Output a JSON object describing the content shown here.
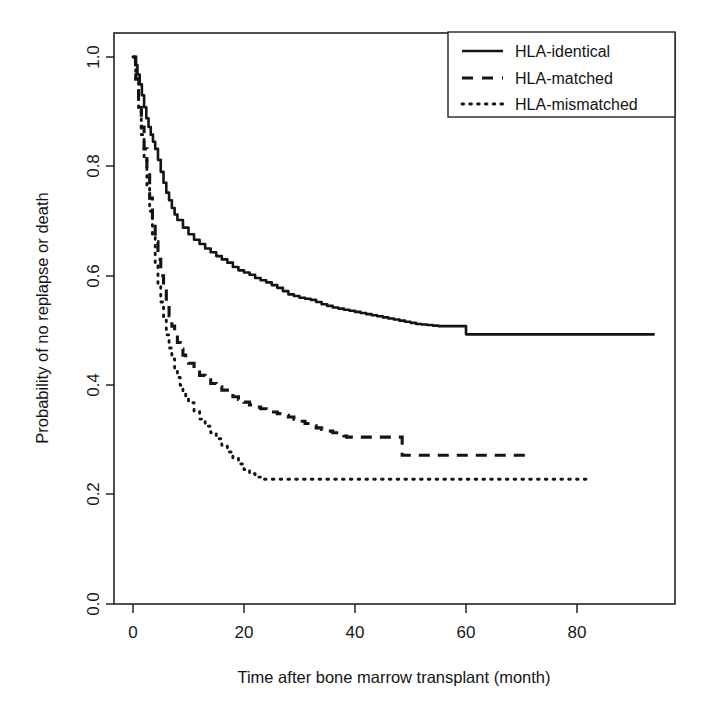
{
  "chart_data": {
    "type": "line",
    "title": "",
    "xlabel": "Time after bone marrow transplant (month)",
    "ylabel": "Probability of no replapse or death",
    "xlim": [
      -4,
      101
    ],
    "ylim": [
      0.0,
      1.04
    ],
    "xticks": [
      0,
      20,
      40,
      60,
      80
    ],
    "xtick_labels": [
      "0",
      "20",
      "40",
      "60",
      "80"
    ],
    "yticks": [
      0.0,
      0.2,
      0.4,
      0.6,
      0.8,
      1.0
    ],
    "ytick_labels": [
      "0.0",
      "0.2",
      "0.4",
      "0.6",
      "0.8",
      "1.0"
    ],
    "grid": false,
    "legend_position": "top-right",
    "series": [
      {
        "name": "HLA-identical",
        "style": "solid",
        "points": [
          [
            0.0,
            1.0
          ],
          [
            0.4,
            0.985
          ],
          [
            0.8,
            0.968
          ],
          [
            1.2,
            0.95
          ],
          [
            1.6,
            0.93
          ],
          [
            2.0,
            0.908
          ],
          [
            2.4,
            0.888
          ],
          [
            2.8,
            0.872
          ],
          [
            3.2,
            0.858
          ],
          [
            3.6,
            0.845
          ],
          [
            4.0,
            0.832
          ],
          [
            4.5,
            0.812
          ],
          [
            5.0,
            0.79
          ],
          [
            5.5,
            0.77
          ],
          [
            6.0,
            0.752
          ],
          [
            6.5,
            0.738
          ],
          [
            7.0,
            0.724
          ],
          [
            7.5,
            0.712
          ],
          [
            8.0,
            0.702
          ],
          [
            9.0,
            0.688
          ],
          [
            10.0,
            0.676
          ],
          [
            11.0,
            0.666
          ],
          [
            12.0,
            0.658
          ],
          [
            13.0,
            0.65
          ],
          [
            14.0,
            0.643
          ],
          [
            15.0,
            0.636
          ],
          [
            16.0,
            0.63
          ],
          [
            17.0,
            0.624
          ],
          [
            18.0,
            0.616
          ],
          [
            19.0,
            0.61
          ],
          [
            20.0,
            0.606
          ],
          [
            21.0,
            0.602
          ],
          [
            22.0,
            0.596
          ],
          [
            23.0,
            0.592
          ],
          [
            24.0,
            0.588
          ],
          [
            25.0,
            0.583
          ],
          [
            26.0,
            0.578
          ],
          [
            27.0,
            0.572
          ],
          [
            28.0,
            0.566
          ],
          [
            29.0,
            0.563
          ],
          [
            30.0,
            0.56
          ],
          [
            31.0,
            0.558
          ],
          [
            32.0,
            0.556
          ],
          [
            33.0,
            0.552
          ],
          [
            34.0,
            0.548
          ],
          [
            35.0,
            0.545
          ],
          [
            36.0,
            0.542
          ],
          [
            37.0,
            0.54
          ],
          [
            38.0,
            0.538
          ],
          [
            39.0,
            0.536
          ],
          [
            40.0,
            0.534
          ],
          [
            41.0,
            0.532
          ],
          [
            42.0,
            0.53
          ],
          [
            43.0,
            0.528
          ],
          [
            44.0,
            0.526
          ],
          [
            45.0,
            0.524
          ],
          [
            46.0,
            0.522
          ],
          [
            47.0,
            0.52
          ],
          [
            48.0,
            0.518
          ],
          [
            49.0,
            0.516
          ],
          [
            50.0,
            0.514
          ],
          [
            51.0,
            0.512
          ],
          [
            52.0,
            0.511
          ],
          [
            53.0,
            0.51
          ],
          [
            54.0,
            0.509
          ],
          [
            55.0,
            0.508
          ],
          [
            56.0,
            0.508
          ],
          [
            59.5,
            0.508
          ],
          [
            60.0,
            0.493
          ],
          [
            94.0,
            0.493
          ]
        ]
      },
      {
        "name": "HLA-matched",
        "style": "dashed",
        "points": [
          [
            0.0,
            1.0
          ],
          [
            0.5,
            0.96
          ],
          [
            1.0,
            0.915
          ],
          [
            1.5,
            0.872
          ],
          [
            2.0,
            0.832
          ],
          [
            2.5,
            0.79
          ],
          [
            3.0,
            0.742
          ],
          [
            3.5,
            0.7
          ],
          [
            4.0,
            0.662
          ],
          [
            4.5,
            0.63
          ],
          [
            5.0,
            0.6
          ],
          [
            5.5,
            0.572
          ],
          [
            6.0,
            0.548
          ],
          [
            6.5,
            0.527
          ],
          [
            7.0,
            0.508
          ],
          [
            7.5,
            0.492
          ],
          [
            8.0,
            0.478
          ],
          [
            8.5,
            0.466
          ],
          [
            9.0,
            0.455
          ],
          [
            9.5,
            0.447
          ],
          [
            10.0,
            0.44
          ],
          [
            11.0,
            0.428
          ],
          [
            12.0,
            0.418
          ],
          [
            13.0,
            0.41
          ],
          [
            14.0,
            0.403
          ],
          [
            15.0,
            0.397
          ],
          [
            16.0,
            0.391
          ],
          [
            17.0,
            0.385
          ],
          [
            18.0,
            0.379
          ],
          [
            19.0,
            0.374
          ],
          [
            20.0,
            0.369
          ],
          [
            21.0,
            0.364
          ],
          [
            22.0,
            0.36
          ],
          [
            23.0,
            0.357
          ],
          [
            24.0,
            0.354
          ],
          [
            25.0,
            0.351
          ],
          [
            26.0,
            0.348
          ],
          [
            27.0,
            0.345
          ],
          [
            28.0,
            0.342
          ],
          [
            29.0,
            0.338
          ],
          [
            30.0,
            0.334
          ],
          [
            31.0,
            0.33
          ],
          [
            32.0,
            0.326
          ],
          [
            33.0,
            0.322
          ],
          [
            34.0,
            0.319
          ],
          [
            35.0,
            0.316
          ],
          [
            36.0,
            0.313
          ],
          [
            37.0,
            0.31
          ],
          [
            38.0,
            0.307
          ],
          [
            38.5,
            0.305
          ],
          [
            48.0,
            0.305
          ],
          [
            48.5,
            0.272
          ],
          [
            71.0,
            0.272
          ]
        ]
      },
      {
        "name": "HLA-mismatched",
        "style": "dotted",
        "points": [
          [
            0.0,
            1.0
          ],
          [
            0.5,
            0.955
          ],
          [
            1.0,
            0.905
          ],
          [
            1.5,
            0.858
          ],
          [
            2.0,
            0.812
          ],
          [
            2.5,
            0.766
          ],
          [
            3.0,
            0.718
          ],
          [
            3.5,
            0.67
          ],
          [
            4.0,
            0.624
          ],
          [
            4.5,
            0.586
          ],
          [
            5.0,
            0.552
          ],
          [
            5.5,
            0.52
          ],
          [
            6.0,
            0.492
          ],
          [
            6.5,
            0.468
          ],
          [
            7.0,
            0.448
          ],
          [
            7.5,
            0.43
          ],
          [
            8.0,
            0.414
          ],
          [
            8.5,
            0.4
          ],
          [
            9.0,
            0.388
          ],
          [
            9.5,
            0.378
          ],
          [
            10.0,
            0.368
          ],
          [
            11.0,
            0.352
          ],
          [
            12.0,
            0.338
          ],
          [
            13.0,
            0.325
          ],
          [
            14.0,
            0.313
          ],
          [
            15.0,
            0.302
          ],
          [
            16.0,
            0.29
          ],
          [
            17.0,
            0.278
          ],
          [
            18.0,
            0.266
          ],
          [
            19.0,
            0.256
          ],
          [
            20.0,
            0.246
          ],
          [
            21.0,
            0.238
          ],
          [
            22.0,
            0.232
          ],
          [
            23.0,
            0.228
          ],
          [
            82.0,
            0.228
          ]
        ]
      }
    ]
  },
  "legend": {
    "entries": [
      {
        "label": "HLA-identical",
        "style": "solid"
      },
      {
        "label": "HLA-matched",
        "style": "dashed"
      },
      {
        "label": "HLA-mismatched",
        "style": "dotted"
      }
    ]
  },
  "axes": {
    "x_title": "Time after bone marrow transplant (month)",
    "y_title": "Probability of no replapse or death",
    "x_tick_labels": [
      "0",
      "20",
      "40",
      "60",
      "80"
    ],
    "y_tick_labels": [
      "0.0",
      "0.2",
      "0.4",
      "0.6",
      "0.8",
      "1.0"
    ]
  },
  "colors": {
    "line": "#141414",
    "axis": "#232323",
    "background": "#ffffff"
  }
}
